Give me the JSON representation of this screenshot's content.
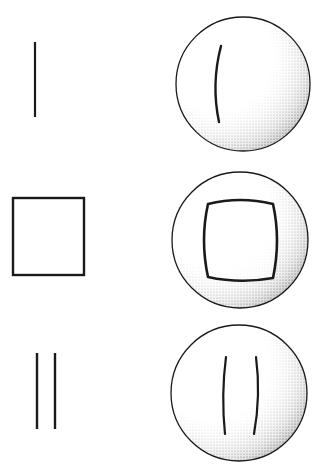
{
  "figure": {
    "colors": {
      "ink": "#1a1a1a",
      "background": "#ffffff",
      "stipple": "#333333"
    },
    "rows": [
      {
        "id": "single-line",
        "original": "line",
        "distorted": "curved-line"
      },
      {
        "id": "square",
        "original": "square",
        "distorted": "pincushion-square"
      },
      {
        "id": "double-line",
        "original": "two-lines",
        "distorted": "two-curved-lines"
      }
    ]
  }
}
